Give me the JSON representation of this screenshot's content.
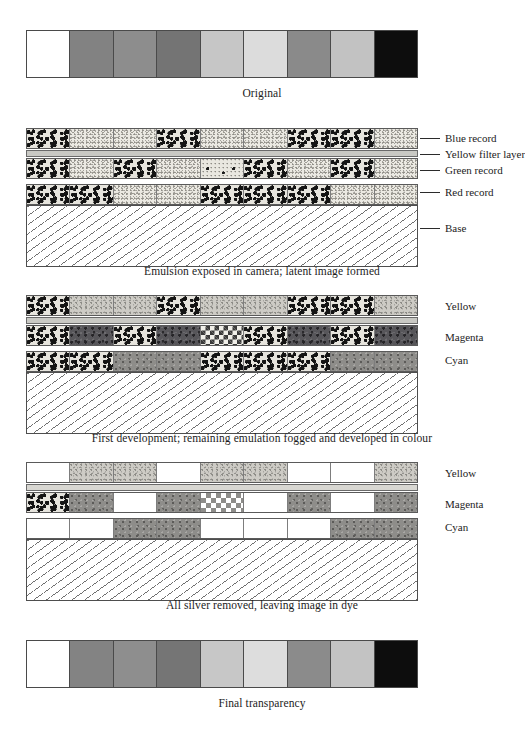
{
  "panels": [
    {
      "id": "original",
      "caption": "Original",
      "type": "tone-strip",
      "cells": [
        {
          "label": "white",
          "color": "#ffffff"
        },
        {
          "label": "mid-grey",
          "color": "#828282"
        },
        {
          "label": "mid-grey-2",
          "color": "#8d8d8d"
        },
        {
          "label": "dark-grey",
          "color": "#747474"
        },
        {
          "label": "light-grey",
          "color": "#c6c6c6"
        },
        {
          "label": "pale-grey",
          "color": "#dcdcdc"
        },
        {
          "label": "mid-grey-3",
          "color": "#8a8a8a"
        },
        {
          "label": "light-grey-2",
          "color": "#c2c2c2"
        },
        {
          "label": "black",
          "color": "#0d0d0d"
        }
      ]
    },
    {
      "id": "latent",
      "caption": "Emulsion exposed in camera; latent image formed",
      "type": "layers",
      "layers": [
        {
          "name": "blue-record",
          "label": "Blue record",
          "cells": [
            "dense",
            "fine",
            "fine",
            "dense",
            "fine",
            "fine",
            "dense",
            "dense",
            "fine"
          ]
        },
        {
          "name": "yellow-filter-layer",
          "label": "Yellow filter layer",
          "cells": []
        },
        {
          "name": "green-record",
          "label": "Green record",
          "cells": [
            "dense",
            "fine",
            "dense",
            "fine",
            "sparse",
            "dense",
            "fine",
            "dense",
            "fine"
          ]
        },
        {
          "name": "red-record",
          "label": "Red record",
          "cells": [
            "dense",
            "dense",
            "fine",
            "fine",
            "dense",
            "dense",
            "dense",
            "fine",
            "fine"
          ]
        }
      ],
      "base_label": "Base"
    },
    {
      "id": "first-development",
      "caption": "First development; remaining emulation fogged and developed in colour",
      "type": "layers",
      "layers": [
        {
          "name": "yellow-layer",
          "label": "Yellow",
          "cells": [
            "dense",
            "light",
            "light",
            "dense",
            "light",
            "light",
            "dense",
            "dense",
            "light"
          ]
        },
        {
          "name": "yellow-filter-layer",
          "label": "",
          "cells": []
        },
        {
          "name": "magenta-layer",
          "label": "Magenta",
          "cells": [
            "dense",
            "dyedark",
            "dense",
            "dyedark",
            "check-dark",
            "dense",
            "dyedark",
            "dense",
            "dyedark"
          ]
        },
        {
          "name": "cyan-layer",
          "label": "Cyan",
          "cells": [
            "dense",
            "dense",
            "dyemid",
            "dyemid",
            "dense",
            "dense",
            "dense",
            "dyemid",
            "dyemid"
          ]
        }
      ],
      "base_label": ""
    },
    {
      "id": "silver-removed",
      "caption": "All silver removed, leaving image in dye",
      "type": "layers",
      "layers": [
        {
          "name": "yellow-layer",
          "label": "Yellow",
          "cells": [
            "plain",
            "light",
            "light",
            "plain",
            "light",
            "light",
            "plain",
            "plain",
            "light"
          ]
        },
        {
          "name": "yellow-filter-layer",
          "label": "",
          "cells": []
        },
        {
          "name": "magenta-layer",
          "label": "Magenta",
          "cells": [
            "dense",
            "dyemid",
            "plain",
            "dyemid",
            "check",
            "plain",
            "dyemid",
            "plain",
            "dyemid"
          ]
        },
        {
          "name": "cyan-layer",
          "label": "Cyan",
          "cells": [
            "plain",
            "plain",
            "dyemid",
            "dyemid",
            "plain",
            "plain",
            "plain",
            "dyemid",
            "dyemid"
          ]
        }
      ],
      "base_label": ""
    },
    {
      "id": "final",
      "caption": "Final transparency",
      "type": "tone-strip",
      "cells": [
        {
          "label": "white",
          "color": "#ffffff"
        },
        {
          "label": "mid-grey",
          "color": "#838383"
        },
        {
          "label": "mid-grey-2",
          "color": "#8e8e8e"
        },
        {
          "label": "dark-grey",
          "color": "#757575"
        },
        {
          "label": "light-grey",
          "color": "#c7c7c7"
        },
        {
          "label": "pale-grey",
          "color": "#dddddd"
        },
        {
          "label": "mid-grey-3",
          "color": "#8b8b8b"
        },
        {
          "label": "light-grey-2",
          "color": "#c3c3c3"
        },
        {
          "label": "black",
          "color": "#0d0d0d"
        }
      ]
    }
  ],
  "colors": {
    "line": "#4a4a4a",
    "text": "#1c1c1c",
    "background": "#ffffff",
    "filter_band": "#c9c9c4"
  }
}
